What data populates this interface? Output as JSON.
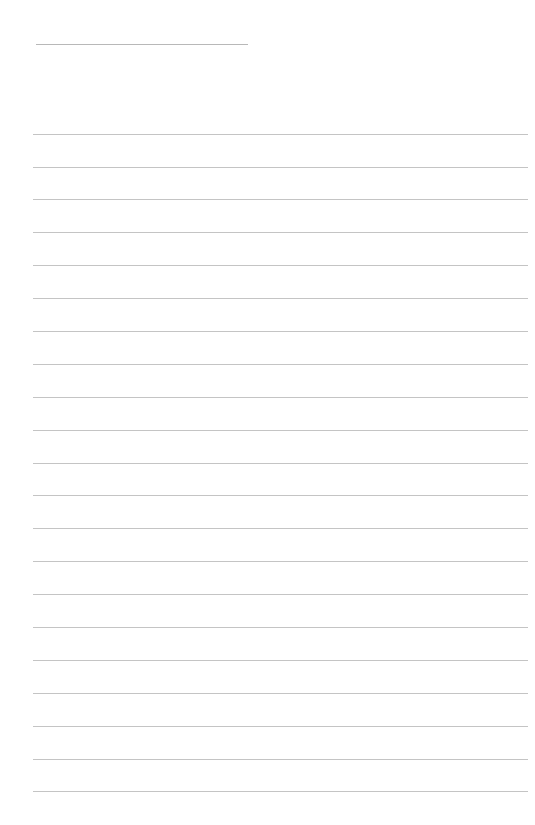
{
  "page": {
    "type": "lined-notepaper",
    "background_color": "#ffffff",
    "line_color": "#c4c4c4",
    "title_line": {
      "left": 36,
      "top": 44,
      "width": 212
    },
    "rules": {
      "left": 33,
      "width": 495,
      "tops": [
        134,
        167,
        199,
        232,
        265,
        298,
        331,
        364,
        397,
        430,
        463,
        495,
        528,
        561,
        594,
        627,
        660,
        693,
        726,
        759,
        791
      ]
    }
  }
}
